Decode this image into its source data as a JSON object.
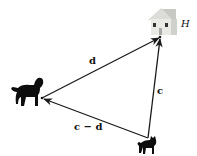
{
  "diagram": {
    "nodes": [
      {
        "id": "house",
        "label": "H",
        "icon": "house-icon",
        "x": 160,
        "y": 37
      },
      {
        "id": "dog",
        "label": "",
        "icon": "dog-icon",
        "x": 42,
        "y": 98
      },
      {
        "id": "cat",
        "label": "",
        "icon": "cat-icon",
        "x": 148,
        "y": 138
      }
    ],
    "vectors": [
      {
        "id": "d",
        "label": "d",
        "from": "dog",
        "to": "house"
      },
      {
        "id": "c",
        "label": "c",
        "from": "cat",
        "to": "house"
      },
      {
        "id": "c_minus_d",
        "label": "c − d",
        "from": "cat",
        "to": "dog"
      }
    ],
    "labels": {
      "house": "H",
      "d": "d",
      "c": "c",
      "c_minus_d": "c − d"
    },
    "colors": {
      "arrow": "#1a1a1a",
      "silhouette": "#0d0d0d",
      "house_wall": "#e6e6e2",
      "house_roof": "#bfbfbb"
    }
  }
}
